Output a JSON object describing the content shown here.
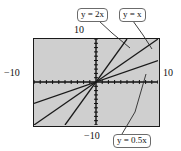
{
  "figure": {
    "kind": "graphing-calculator-plot",
    "background_color": "#cfcfcf",
    "frame_color": "#1a1a1a",
    "axis_labels": {
      "left": "−10",
      "right": "10",
      "top": "10",
      "bottom": "−10"
    },
    "callouts": [
      {
        "id": "line-2x",
        "text": "y = 2x"
      },
      {
        "id": "line-x",
        "text": "y = x"
      },
      {
        "id": "line-half",
        "text": "y = 0.5x"
      }
    ]
  },
  "chart_data": {
    "type": "line",
    "title": "",
    "xlabel": "",
    "ylabel": "",
    "xlim": [
      -10,
      10
    ],
    "ylim": [
      -10,
      10
    ],
    "xticks": [
      -10,
      -9,
      -8,
      -7,
      -6,
      -5,
      -4,
      -3,
      -2,
      -1,
      0,
      1,
      2,
      3,
      4,
      5,
      6,
      7,
      8,
      9,
      10
    ],
    "yticks": [
      -10,
      -9,
      -8,
      -7,
      -6,
      -5,
      -4,
      -3,
      -2,
      -1,
      0,
      1,
      2,
      3,
      4,
      5,
      6,
      7,
      8,
      9,
      10
    ],
    "grid": false,
    "legend": "callout-boxes",
    "series": [
      {
        "name": "y = 2x",
        "slope": 2,
        "intercept": 0,
        "x": [
          -5,
          5
        ],
        "values": [
          -10,
          10
        ],
        "color": "#1a1a1a"
      },
      {
        "name": "y = x",
        "slope": 1,
        "intercept": 0,
        "x": [
          -10,
          10
        ],
        "values": [
          -10,
          10
        ],
        "color": "#1a1a1a"
      },
      {
        "name": "y = 0.5x",
        "slope": 0.5,
        "intercept": 0,
        "x": [
          -10,
          10
        ],
        "values": [
          -5,
          5
        ],
        "color": "#1a1a1a"
      }
    ]
  }
}
